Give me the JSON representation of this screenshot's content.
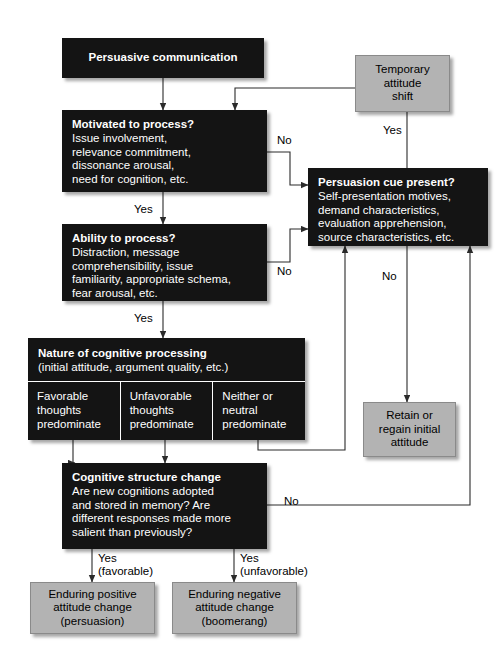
{
  "figure": {
    "kind": "flowchart"
  },
  "nodes": {
    "persuasive_communication": {
      "title": "Persuasive communication"
    },
    "temporary_attitude_shift": {
      "text": "Temporary\nattitude\nshift"
    },
    "motivated": {
      "title": "Motivated to process?",
      "body": "Issue involvement,\nrelevance commitment,\ndissonance arousal,\nneed for cognition, etc."
    },
    "persuasion_cue": {
      "title": "Persuasion cue present?",
      "body": "Self-presentation motives,\ndemand characteristics,\nevaluation apprehension,\nsource characteristics, etc."
    },
    "ability": {
      "title": "Ability to process?",
      "body": "Distraction, message\ncomprehensibility, issue\nfamiliarity, appropriate schema,\nfear arousal, etc."
    },
    "nature": {
      "title": "Nature of cognitive processing",
      "body": "(initial attitude, argument quality, etc.)",
      "columns": [
        "Favorable\nthoughts\npredominate",
        "Unfavorable\nthoughts\npredominate",
        "Neither or\nneutral\npredominate"
      ]
    },
    "retain": {
      "text": "Retain or\nregain initial\nattitude"
    },
    "cognitive_structure": {
      "title": "Cognitive structure change",
      "body": "Are new cognitions adopted\nand stored in memory? Are\ndifferent responses made more\nsalient than previously?"
    },
    "enduring_positive": {
      "text": "Enduring positive\nattitude change\n(persuasion)"
    },
    "enduring_negative": {
      "text": "Enduring negative\nattitude change\n(boomerang)"
    }
  },
  "edge_labels": {
    "motivated_no": "No",
    "motivated_yes": "Yes",
    "ability_no": "No",
    "ability_yes": "Yes",
    "nature_yes": "Yes",
    "cue_yes": "Yes",
    "cue_no": "No",
    "structure_no": "No",
    "structure_yes_favorable": "Yes\n(favorable)",
    "structure_yes_unfavorable": "Yes\n(unfavorable)"
  },
  "colors": {
    "dark_box": "#141414",
    "grey_box": "#b3b3b3",
    "line": "#2b2b2b",
    "page": "#ffffff"
  }
}
